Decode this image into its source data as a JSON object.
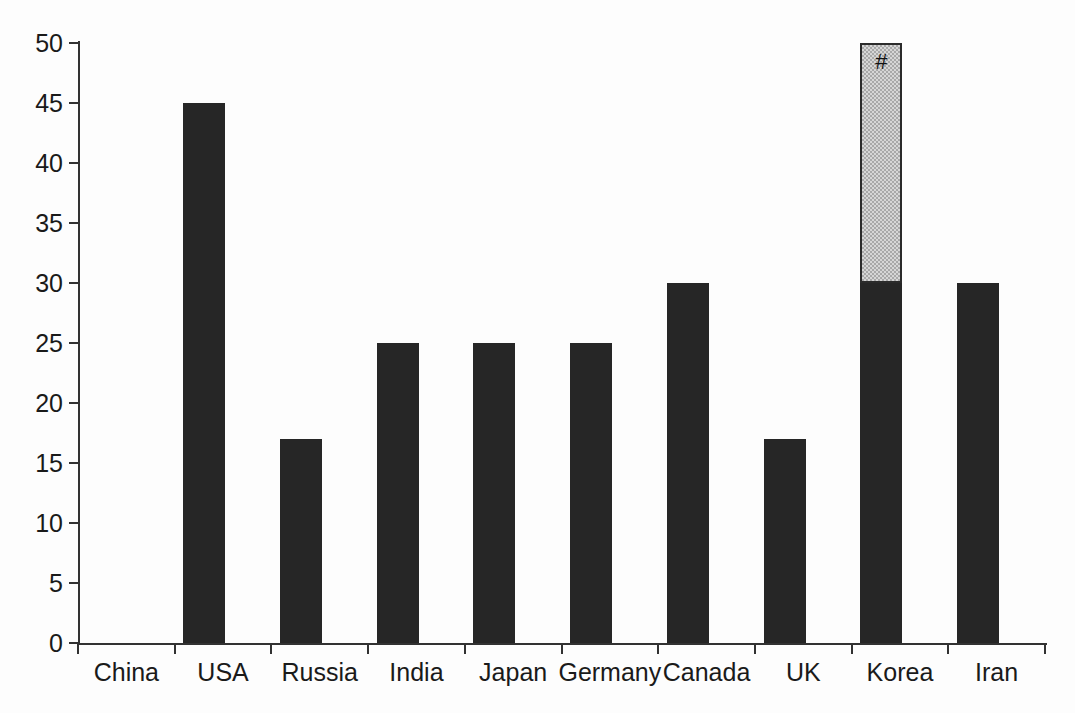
{
  "chart_data": {
    "type": "bar",
    "title": "",
    "subtitle": "",
    "xlabel": "",
    "ylabel": "",
    "categories": [
      "China",
      "USA",
      "Russia",
      "India",
      "Japan",
      "Germany",
      "Canada",
      "UK",
      "Korea",
      "Iran"
    ],
    "values": [
      45,
      17,
      25,
      25,
      25,
      30,
      17,
      30,
      30,
      0
    ],
    "ylim": [
      0,
      50
    ],
    "yticks": [
      0,
      5,
      10,
      15,
      20,
      25,
      30,
      35,
      40,
      45,
      50
    ],
    "ytick_labels": [
      "0",
      "5",
      "10",
      "15",
      "20",
      "25",
      "30",
      "35",
      "40",
      "45",
      "50"
    ],
    "grid": false,
    "legend": null,
    "bar_color": "#262626",
    "highlight_color": "#d6d6d6",
    "axis_color": "#323232",
    "background_color": "#fdfdfd",
    "bars": [
      {
        "category": "China",
        "value": 45,
        "style": "solid",
        "annotation": ""
      },
      {
        "category": "USA",
        "value": 17,
        "style": "solid",
        "annotation": ""
      },
      {
        "category": "Russia",
        "value": 25,
        "style": "solid",
        "annotation": ""
      },
      {
        "category": "India",
        "value": 25,
        "style": "solid",
        "annotation": ""
      },
      {
        "category": "Japan",
        "value": 25,
        "style": "solid",
        "annotation": ""
      },
      {
        "category": "Germany",
        "value": 30,
        "style": "solid",
        "annotation": ""
      },
      {
        "category": "Canada",
        "value": 17,
        "style": "solid",
        "annotation": ""
      },
      {
        "category": "UK",
        "value": 30,
        "style": "solid",
        "annotation": "",
        "extension_to": 50,
        "extension_style": "hatched",
        "extension_annotation": "#"
      },
      {
        "category": "Korea",
        "value": 30,
        "style": "solid",
        "annotation": ""
      },
      {
        "category": "Iran",
        "value": 0,
        "style": "solid",
        "annotation": ""
      }
    ],
    "annotations": [
      {
        "text": "#",
        "at_category": "UK",
        "at_value": 50,
        "meaning": "hash-marker"
      }
    ]
  }
}
